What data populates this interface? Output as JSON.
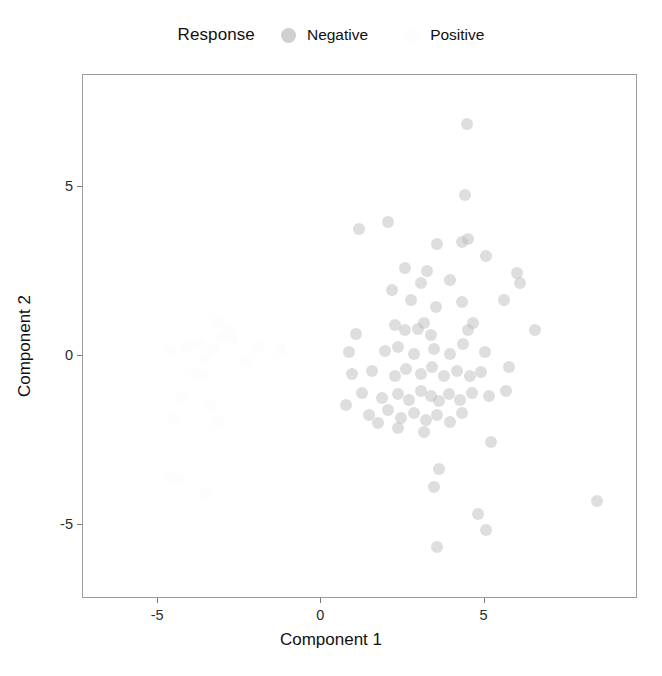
{
  "legend": {
    "title": "Response",
    "position": "top",
    "entries": [
      {
        "label": "Negative",
        "key_icon": "filled-circle-icon",
        "color": "#d0d0d0"
      },
      {
        "label": "Positive",
        "key_icon": "filled-circle-icon",
        "color": "#fdfdfd"
      }
    ]
  },
  "axes": {
    "x": {
      "label": "Component 1",
      "ticks": [
        "-5",
        "0",
        "5"
      ],
      "tick_values": [
        -5,
        0,
        5
      ],
      "range": [
        -7.3,
        9.7
      ]
    },
    "y": {
      "label": "Component 2",
      "ticks": [
        "5",
        "0",
        "-5"
      ],
      "tick_values": [
        5,
        0,
        -5
      ],
      "range": [
        -7.2,
        8.3
      ]
    }
  },
  "chart_data": {
    "type": "scatter",
    "title": "",
    "xlabel": "Component 1",
    "ylabel": "Component 2",
    "xlim": [
      -7.3,
      9.7
    ],
    "ylim": [
      -7.2,
      8.3
    ],
    "grid": false,
    "legend_position": "top",
    "legend_title": "Response",
    "point_opacity": 0.45,
    "point_size": 12,
    "series": [
      {
        "name": "Negative",
        "color": "#b5b5b5",
        "points": [
          [
            4.45,
            6.85
          ],
          [
            4.4,
            4.75
          ],
          [
            1.15,
            3.75
          ],
          [
            2.05,
            3.95
          ],
          [
            3.55,
            3.3
          ],
          [
            4.3,
            3.35
          ],
          [
            4.5,
            3.45
          ],
          [
            5.05,
            2.95
          ],
          [
            2.55,
            2.6
          ],
          [
            3.25,
            2.5
          ],
          [
            3.05,
            2.15
          ],
          [
            3.95,
            2.25
          ],
          [
            6.0,
            2.45
          ],
          [
            6.1,
            2.15
          ],
          [
            2.15,
            1.95
          ],
          [
            2.75,
            1.65
          ],
          [
            3.5,
            1.45
          ],
          [
            4.3,
            1.6
          ],
          [
            5.6,
            1.65
          ],
          [
            1.05,
            0.65
          ],
          [
            2.25,
            0.9
          ],
          [
            2.55,
            0.75
          ],
          [
            2.95,
            0.8
          ],
          [
            3.15,
            0.95
          ],
          [
            3.35,
            0.6
          ],
          [
            4.5,
            0.75
          ],
          [
            4.65,
            0.95
          ],
          [
            6.55,
            0.75
          ],
          [
            0.85,
            0.1
          ],
          [
            1.95,
            0.15
          ],
          [
            2.35,
            0.25
          ],
          [
            2.85,
            0.05
          ],
          [
            3.45,
            0.2
          ],
          [
            3.95,
            0.05
          ],
          [
            4.35,
            0.35
          ],
          [
            5.0,
            0.1
          ],
          [
            5.75,
            -0.35
          ],
          [
            0.95,
            -0.55
          ],
          [
            1.55,
            -0.45
          ],
          [
            2.25,
            -0.6
          ],
          [
            2.6,
            -0.4
          ],
          [
            3.05,
            -0.55
          ],
          [
            3.4,
            -0.35
          ],
          [
            3.75,
            -0.6
          ],
          [
            4.15,
            -0.45
          ],
          [
            4.55,
            -0.6
          ],
          [
            4.9,
            -0.5
          ],
          [
            1.25,
            -1.1
          ],
          [
            1.85,
            -1.25
          ],
          [
            2.35,
            -1.15
          ],
          [
            2.7,
            -1.3
          ],
          [
            3.05,
            -1.05
          ],
          [
            3.35,
            -1.2
          ],
          [
            3.6,
            -1.35
          ],
          [
            3.9,
            -1.15
          ],
          [
            4.25,
            -1.3
          ],
          [
            4.6,
            -1.1
          ],
          [
            5.15,
            -1.2
          ],
          [
            5.65,
            -1.05
          ],
          [
            0.75,
            -1.45
          ],
          [
            1.45,
            -1.75
          ],
          [
            2.05,
            -1.6
          ],
          [
            2.45,
            -1.85
          ],
          [
            2.85,
            -1.7
          ],
          [
            3.2,
            -1.9
          ],
          [
            3.55,
            -1.75
          ],
          [
            3.95,
            -1.95
          ],
          [
            4.3,
            -1.7
          ],
          [
            5.2,
            -2.55
          ],
          [
            2.35,
            -2.15
          ],
          [
            3.15,
            -2.25
          ],
          [
            1.75,
            -2.0
          ],
          [
            3.6,
            -3.35
          ],
          [
            3.45,
            -3.9
          ],
          [
            8.45,
            -4.3
          ],
          [
            4.8,
            -4.7
          ],
          [
            5.05,
            -5.15
          ],
          [
            3.55,
            -5.65
          ]
        ]
      },
      {
        "name": "Positive",
        "color": "#fbfbfb",
        "points": [
          [
            -3.2,
            0.95
          ],
          [
            -2.85,
            0.75
          ],
          [
            -3.05,
            0.55
          ],
          [
            -2.7,
            0.5
          ],
          [
            -4.1,
            0.25
          ],
          [
            -3.75,
            0.3
          ],
          [
            -3.35,
            0.2
          ],
          [
            -1.95,
            0.25
          ],
          [
            -1.25,
            0.2
          ],
          [
            -4.6,
            0.15
          ],
          [
            -3.55,
            -0.1
          ],
          [
            -2.35,
            -0.15
          ],
          [
            -3.85,
            -0.55
          ],
          [
            -3.6,
            -0.6
          ],
          [
            -4.3,
            -1.25
          ],
          [
            -3.4,
            -1.45
          ],
          [
            -4.55,
            -1.85
          ],
          [
            -3.15,
            -1.95
          ],
          [
            -4.65,
            -3.6
          ],
          [
            -4.35,
            -3.65
          ],
          [
            -3.55,
            -4.1
          ]
        ]
      }
    ]
  }
}
